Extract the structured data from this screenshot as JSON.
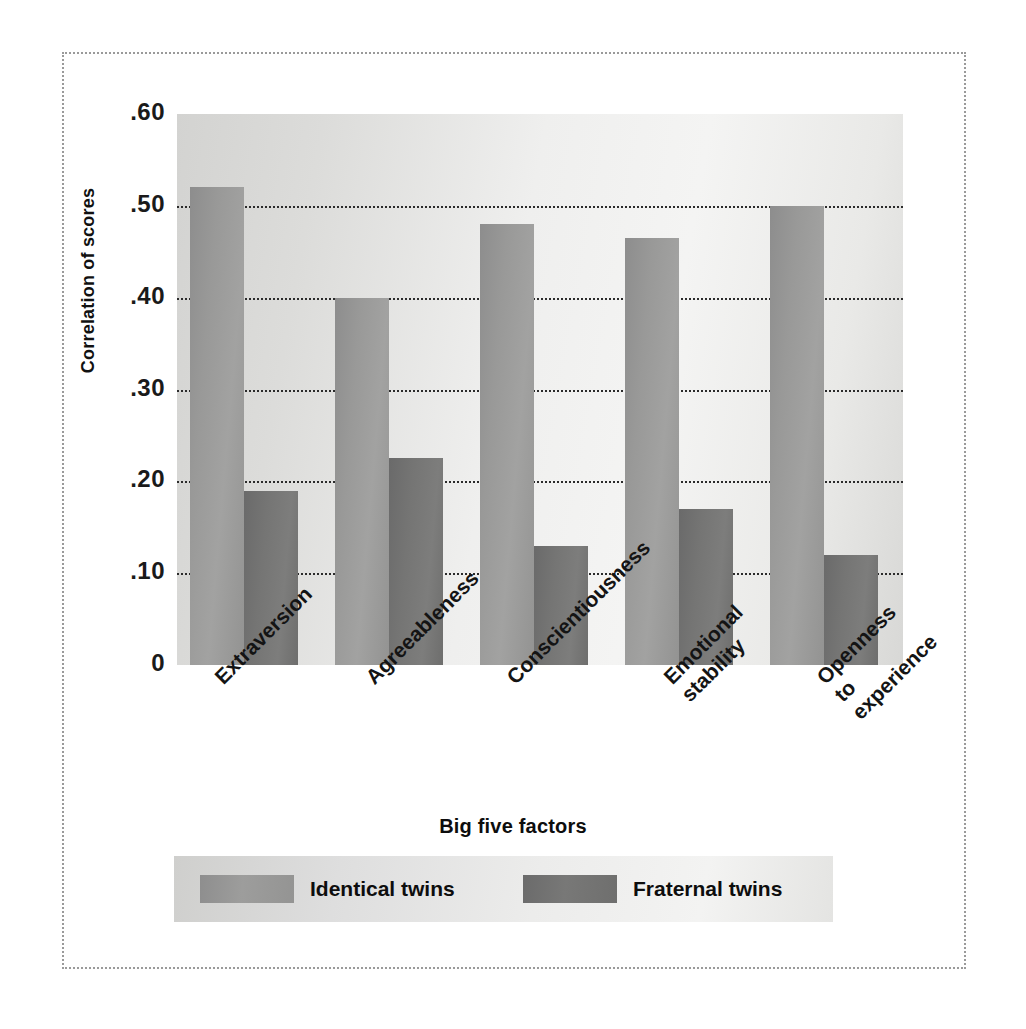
{
  "chart_data": {
    "type": "bar",
    "title": "",
    "xlabel": "Big five factors",
    "ylabel": "Correlation of scores",
    "ylim": [
      0,
      0.6
    ],
    "ytick_labels": [
      "0",
      ".10",
      ".20",
      ".30",
      ".40",
      ".50",
      ".60"
    ],
    "ytick_values": [
      0,
      0.1,
      0.2,
      0.3,
      0.4,
      0.5,
      0.6
    ],
    "grid": "horizontal dotted gridlines at .10 .20 .30 .40 .50",
    "legend_position": "bottom",
    "categories": [
      "Extraversion",
      "Agreeableness",
      "Conscientiousness",
      "Emotional\nstability",
      "Openness\nto\nexperience"
    ],
    "series": [
      {
        "name": "Identical twins",
        "color": "#9a9a99",
        "values": [
          0.52,
          0.4,
          0.48,
          0.465,
          0.5
        ]
      },
      {
        "name": "Fraternal twins",
        "color": "#757574",
        "values": [
          0.19,
          0.225,
          0.13,
          0.17,
          0.12
        ]
      }
    ]
  },
  "axes": {
    "y_title": "Correlation of scores",
    "x_title": "Big five factors"
  },
  "legend": {
    "items": [
      {
        "label": "Identical twins"
      },
      {
        "label": "Fraternal twins"
      }
    ]
  },
  "colors": {
    "identical_twins": "#9a9a99",
    "fraternal_twins": "#757574",
    "plot_background": "#ececeb",
    "frame": "#9a9a9a",
    "gridline": "#2b2b2b"
  }
}
